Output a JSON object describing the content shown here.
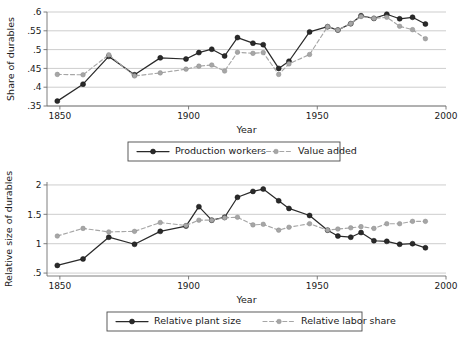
{
  "figure": {
    "background": "#ffffff",
    "series_solid_color": "#2a2a2a",
    "series_dashed_color": "#a6a6a6",
    "grid_color": "#b8b8b8",
    "axis_color": "#6f6f6f"
  },
  "chart_data": [
    {
      "id": "top",
      "type": "line",
      "title": "",
      "xlabel": "Year",
      "ylabel": "Share of durables",
      "xlim": [
        1845,
        2000
      ],
      "ylim": [
        0.35,
        0.6
      ],
      "xticks": [
        1850,
        1900,
        1950,
        2000
      ],
      "xticklabels": [
        "1850",
        "1900",
        "1950",
        "2000"
      ],
      "yticks": [
        0.35,
        0.4,
        0.45,
        0.5,
        0.55,
        0.6
      ],
      "yticklabels": [
        ".35",
        ".4",
        ".45",
        ".5",
        ".55",
        ".6"
      ],
      "grid": "horizontal",
      "legend_position": "below",
      "series": [
        {
          "name": "Production workers",
          "style": "solid",
          "marker": "filled-circle",
          "color": "#2a2a2a",
          "x": [
            1849,
            1859,
            1869,
            1879,
            1889,
            1899,
            1904,
            1909,
            1914,
            1919,
            1925,
            1929,
            1935,
            1939,
            1947,
            1954,
            1958,
            1963,
            1967,
            1972,
            1977,
            1982,
            1987,
            1992
          ],
          "values": [
            0.363,
            0.408,
            0.482,
            0.433,
            0.478,
            0.475,
            0.492,
            0.501,
            0.483,
            0.532,
            0.517,
            0.513,
            0.45,
            0.469,
            0.547,
            0.561,
            0.552,
            0.569,
            0.59,
            0.583,
            0.594,
            0.582,
            0.586,
            0.568
          ]
        },
        {
          "name": "Value added",
          "style": "dashed",
          "marker": "filled-circle",
          "color": "#a6a6a6",
          "x": [
            1849,
            1859,
            1869,
            1879,
            1889,
            1899,
            1904,
            1909,
            1914,
            1919,
            1925,
            1929,
            1935,
            1939,
            1947,
            1954,
            1958,
            1963,
            1967,
            1972,
            1977,
            1982,
            1987,
            1992
          ],
          "values": [
            0.434,
            0.433,
            0.486,
            0.43,
            0.438,
            0.448,
            0.456,
            0.459,
            0.443,
            0.493,
            0.49,
            0.492,
            0.434,
            0.462,
            0.487,
            0.561,
            0.552,
            0.569,
            0.588,
            0.583,
            0.586,
            0.562,
            0.553,
            0.529
          ]
        }
      ]
    },
    {
      "id": "bottom",
      "type": "line",
      "title": "",
      "xlabel": "Year",
      "ylabel": "Relative size of durables",
      "xlim": [
        1845,
        2000
      ],
      "ylim": [
        0.45,
        2.05
      ],
      "xticks": [
        1850,
        1900,
        1950,
        2000
      ],
      "xticklabels": [
        "1850",
        "1900",
        "1950",
        "2000"
      ],
      "yticks": [
        0.5,
        1,
        1.5,
        2
      ],
      "yticklabels": [
        ".5",
        "1",
        "1.5",
        "2"
      ],
      "grid": "horizontal",
      "legend_position": "below",
      "series": [
        {
          "name": "Relative plant size",
          "style": "solid",
          "marker": "filled-circle",
          "color": "#2a2a2a",
          "x": [
            1849,
            1859,
            1869,
            1879,
            1889,
            1899,
            1904,
            1909,
            1914,
            1919,
            1925,
            1929,
            1935,
            1939,
            1947,
            1954,
            1958,
            1963,
            1967,
            1972,
            1977,
            1982,
            1987,
            1992
          ],
          "values": [
            0.63,
            0.74,
            1.11,
            0.99,
            1.21,
            1.3,
            1.63,
            1.4,
            1.45,
            1.79,
            1.89,
            1.93,
            1.73,
            1.6,
            1.48,
            1.23,
            1.13,
            1.11,
            1.19,
            1.05,
            1.04,
            0.99,
            1.0,
            0.93
          ]
        },
        {
          "name": "Relative labor share",
          "style": "dashed",
          "marker": "filled-circle",
          "color": "#a6a6a6",
          "x": [
            1849,
            1859,
            1869,
            1879,
            1889,
            1899,
            1904,
            1909,
            1914,
            1919,
            1925,
            1929,
            1935,
            1939,
            1947,
            1954,
            1958,
            1963,
            1967,
            1972,
            1977,
            1982,
            1987,
            1992
          ],
          "values": [
            1.13,
            1.26,
            1.2,
            1.21,
            1.36,
            1.31,
            1.4,
            1.4,
            1.44,
            1.45,
            1.32,
            1.33,
            1.23,
            1.28,
            1.34,
            1.23,
            1.25,
            1.27,
            1.29,
            1.26,
            1.34,
            1.34,
            1.38,
            1.38
          ]
        }
      ]
    }
  ]
}
